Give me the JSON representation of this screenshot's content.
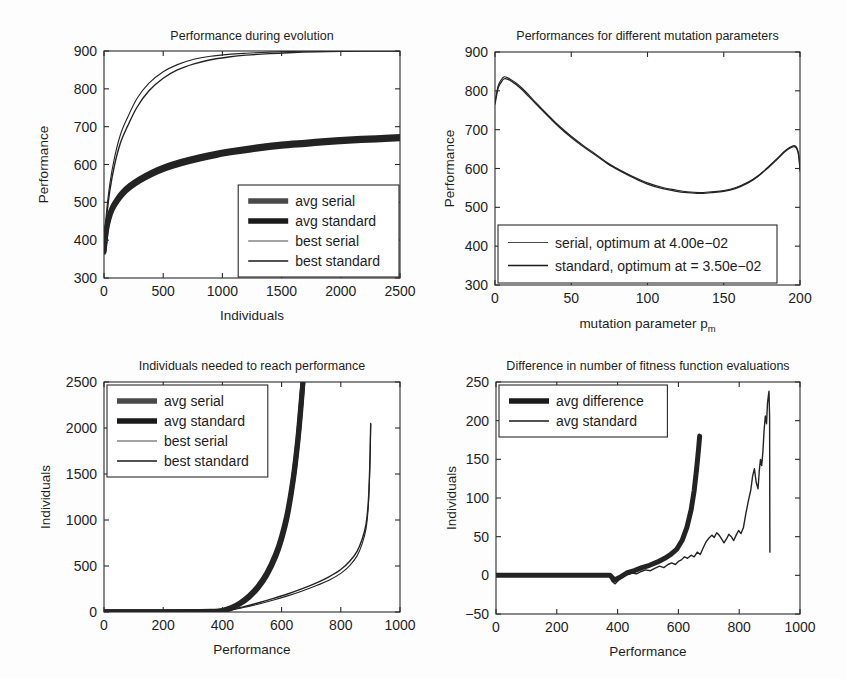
{
  "figure": {
    "background": "#fdfdfd",
    "line_color": "#232323",
    "axis_color": "#2a2a2a"
  },
  "chart_data": [
    {
      "id": "performance-during-evolution",
      "type": "line",
      "title": "Performance during evolution",
      "xlabel": "Individuals",
      "ylabel": "Performance",
      "xlim": [
        0,
        2500
      ],
      "ylim": [
        300,
        900
      ],
      "xticks": [
        0,
        500,
        1000,
        1500,
        2000,
        2500
      ],
      "xticklabels": [
        "0",
        "500",
        "1000",
        "1500",
        "2000",
        "2500"
      ],
      "yticks": [
        300,
        400,
        500,
        600,
        700,
        800,
        900
      ],
      "yticklabels": [
        "300",
        "400",
        "500",
        "600",
        "700",
        "800",
        "900"
      ],
      "grid": false,
      "legend_position": "lower-right",
      "legend": [
        {
          "label": "avg serial",
          "width": 5.5,
          "color": "#4a4a4a"
        },
        {
          "label": "avg standard",
          "width": 5.5,
          "color": "#1a1a1a"
        },
        {
          "label": "best serial",
          "width": 1.1,
          "color": "#4a4a4a"
        },
        {
          "label": "best standard",
          "width": 1.4,
          "color": "#1a1a1a"
        }
      ],
      "series": [
        {
          "name": "avg serial",
          "width": 5.0,
          "color": "#4a4a4a",
          "x": [
            0,
            20,
            40,
            70,
            110,
            160,
            220,
            300,
            400,
            520,
            650,
            800,
            950,
            1100,
            1300,
            1500,
            1700,
            1900,
            2100,
            2300,
            2500
          ],
          "y": [
            372,
            430,
            460,
            487,
            508,
            528,
            545,
            562,
            579,
            595,
            608,
            620,
            630,
            638,
            647,
            654,
            659,
            664,
            668,
            671,
            674
          ]
        },
        {
          "name": "avg standard",
          "width": 5.0,
          "color": "#1a1a1a",
          "x": [
            0,
            20,
            40,
            70,
            110,
            160,
            220,
            300,
            400,
            520,
            650,
            800,
            950,
            1100,
            1300,
            1500,
            1700,
            1900,
            2100,
            2300,
            2500
          ],
          "y": [
            368,
            424,
            454,
            481,
            502,
            522,
            539,
            556,
            573,
            589,
            602,
            614,
            624,
            632,
            641,
            648,
            653,
            658,
            662,
            665,
            668
          ]
        },
        {
          "name": "best serial",
          "width": 1.1,
          "color": "#4a4a4a",
          "x": [
            0,
            20,
            50,
            90,
            140,
            200,
            280,
            380,
            500,
            620,
            760,
            900,
            1050,
            1200,
            1400,
            1600,
            1800,
            2000,
            2200,
            2500
          ],
          "y": [
            390,
            470,
            550,
            620,
            680,
            725,
            775,
            815,
            845,
            864,
            878,
            886,
            891,
            894,
            897,
            899,
            900,
            900,
            900,
            900
          ]
        },
        {
          "name": "best standard",
          "width": 1.4,
          "color": "#1a1a1a",
          "x": [
            0,
            20,
            50,
            90,
            140,
            200,
            280,
            380,
            500,
            620,
            760,
            900,
            1050,
            1200,
            1400,
            1600,
            1800,
            2000,
            2200,
            2500
          ],
          "y": [
            382,
            455,
            532,
            600,
            658,
            702,
            752,
            795,
            828,
            850,
            866,
            877,
            884,
            889,
            893,
            896,
            898,
            899,
            900,
            900
          ]
        }
      ]
    },
    {
      "id": "performances-mutation-parameters",
      "type": "line",
      "title": "Performances for different mutation parameters",
      "xlabel": "mutation parameter p",
      "xlabel_subscript": "m",
      "ylabel": "Performance",
      "xlim": [
        0,
        200
      ],
      "ylim": [
        300,
        900
      ],
      "xticks": [
        0,
        50,
        100,
        150,
        200
      ],
      "xticklabels": [
        "0",
        "50",
        "100",
        "150",
        "200"
      ],
      "yticks": [
        300,
        400,
        500,
        600,
        700,
        800,
        900
      ],
      "yticklabels": [
        "300",
        "400",
        "500",
        "600",
        "700",
        "800",
        "900"
      ],
      "grid": false,
      "legend_position": "lower-left",
      "legend": [
        {
          "label": "serial, optimum at 4.00e−02",
          "width": 1.1,
          "color": "#4a4a4a"
        },
        {
          "label": "standard, optimum at = 3.50e−02",
          "width": 1.3,
          "color": "#1a1a1a"
        }
      ],
      "series": [
        {
          "name": "serial",
          "width": 1.1,
          "color": "#4a4a4a",
          "x": [
            0,
            2,
            4,
            6,
            8,
            10,
            14,
            18,
            22,
            26,
            30,
            36,
            42,
            50,
            58,
            66,
            74,
            82,
            90,
            100,
            110,
            118,
            126,
            134,
            142,
            150,
            158,
            166,
            172,
            178,
            184,
            190,
            194,
            197,
            199,
            200
          ],
          "y": [
            770,
            812,
            828,
            836,
            834,
            830,
            820,
            806,
            790,
            773,
            757,
            733,
            710,
            683,
            659,
            637,
            614,
            596,
            580,
            563,
            551,
            545,
            540,
            538,
            540,
            543,
            551,
            565,
            580,
            600,
            622,
            645,
            656,
            658,
            640,
            598
          ]
        },
        {
          "name": "standard",
          "width": 1.3,
          "color": "#1a1a1a",
          "x": [
            0,
            2,
            4,
            6,
            8,
            10,
            14,
            18,
            22,
            26,
            30,
            36,
            42,
            50,
            58,
            66,
            74,
            82,
            90,
            100,
            110,
            118,
            126,
            134,
            142,
            150,
            158,
            166,
            172,
            178,
            184,
            190,
            194,
            197,
            199,
            200
          ],
          "y": [
            766,
            806,
            822,
            831,
            830,
            827,
            816,
            802,
            786,
            770,
            754,
            730,
            707,
            680,
            656,
            634,
            612,
            594,
            578,
            560,
            548,
            542,
            538,
            536,
            538,
            541,
            549,
            563,
            578,
            598,
            620,
            643,
            654,
            655,
            636,
            594
          ]
        }
      ]
    },
    {
      "id": "individuals-needed-to-reach-performance",
      "type": "line",
      "title": "Individuals needed to reach performance",
      "xlabel": "Performance",
      "ylabel": "Individuals",
      "xlim": [
        0,
        1000
      ],
      "ylim": [
        0,
        2500
      ],
      "xticks": [
        0,
        200,
        400,
        600,
        800,
        1000
      ],
      "xticklabels": [
        "0",
        "200",
        "400",
        "600",
        "800",
        "1000"
      ],
      "yticks": [
        0,
        500,
        1000,
        1500,
        2000,
        2500
      ],
      "yticklabels": [
        "0",
        "500",
        "1000",
        "1500",
        "2000",
        "2500"
      ],
      "grid": false,
      "legend_position": "upper-left",
      "legend": [
        {
          "label": "avg serial",
          "width": 5.5,
          "color": "#4a4a4a"
        },
        {
          "label": "avg standard",
          "width": 5.5,
          "color": "#1a1a1a"
        },
        {
          "label": "best serial",
          "width": 1.1,
          "color": "#4a4a4a"
        },
        {
          "label": "best standard",
          "width": 1.4,
          "color": "#1a1a1a"
        }
      ],
      "series": [
        {
          "name": "avg serial",
          "width": 5.0,
          "color": "#4a4a4a",
          "x": [
            0,
            200,
            360,
            400,
            430,
            460,
            490,
            520,
            550,
            580,
            600,
            620,
            640,
            655,
            665,
            672
          ],
          "y": [
            2,
            3,
            6,
            14,
            40,
            90,
            160,
            260,
            400,
            600,
            790,
            1050,
            1440,
            1850,
            2200,
            2500
          ]
        },
        {
          "name": "avg standard",
          "width": 5.0,
          "color": "#1a1a1a",
          "x": [
            0,
            200,
            360,
            400,
            430,
            460,
            490,
            520,
            550,
            580,
            600,
            620,
            640,
            655,
            665,
            672
          ],
          "y": [
            2,
            3,
            7,
            18,
            48,
            100,
            175,
            280,
            425,
            630,
            825,
            1090,
            1480,
            1890,
            2250,
            2500
          ]
        },
        {
          "name": "best serial",
          "width": 1.1,
          "color": "#4a4a4a",
          "x": [
            0,
            200,
            360,
            420,
            470,
            520,
            570,
            620,
            670,
            720,
            760,
            800,
            830,
            855,
            872,
            885,
            893,
            898,
            901
          ],
          "y": [
            2,
            3,
            7,
            20,
            48,
            85,
            128,
            175,
            228,
            290,
            345,
            420,
            505,
            610,
            740,
            900,
            1150,
            1550,
            2040
          ]
        },
        {
          "name": "best standard",
          "width": 1.4,
          "color": "#1a1a1a",
          "x": [
            0,
            200,
            360,
            420,
            470,
            520,
            570,
            620,
            670,
            720,
            760,
            800,
            830,
            855,
            872,
            885,
            893,
            898,
            901
          ],
          "y": [
            2,
            3,
            8,
            24,
            56,
            98,
            145,
            196,
            254,
            320,
            382,
            462,
            552,
            660,
            790,
            950,
            1200,
            1600,
            2050
          ]
        }
      ]
    },
    {
      "id": "difference-fitness-function-evaluations",
      "type": "line",
      "title": "Difference in number of fitness function evaluations",
      "xlabel": "Performance",
      "ylabel": "Individuals",
      "xlim": [
        0,
        1000
      ],
      "ylim": [
        -50,
        250
      ],
      "xticks": [
        0,
        200,
        400,
        600,
        800,
        1000
      ],
      "xticklabels": [
        "0",
        "200",
        "400",
        "600",
        "800",
        "1000"
      ],
      "yticks": [
        -50,
        0,
        50,
        100,
        150,
        200,
        250
      ],
      "yticklabels": [
        "−50",
        "0",
        "50",
        "100",
        "150",
        "200",
        "250"
      ],
      "grid": false,
      "legend_position": "upper-left",
      "legend": [
        {
          "label": "avg difference",
          "width": 5.5,
          "color": "#1a1a1a"
        },
        {
          "label": "avg standard",
          "width": 1.4,
          "color": "#1a1a1a"
        }
      ],
      "series": [
        {
          "name": "avg difference",
          "width": 5.0,
          "color": "#1a1a1a",
          "x": [
            0,
            120,
            240,
            340,
            375,
            390,
            410,
            430,
            455,
            480,
            505,
            530,
            555,
            575,
            595,
            612,
            628,
            642,
            652,
            660,
            666,
            670
          ],
          "y": [
            0,
            0,
            0,
            0,
            0,
            -6,
            -2,
            3,
            6,
            10,
            13,
            17,
            22,
            27,
            34,
            45,
            62,
            85,
            110,
            138,
            162,
            180
          ]
        },
        {
          "name": "avg standard",
          "width": 1.4,
          "color": "#1a1a1a",
          "x": [
            0,
            120,
            240,
            340,
            372,
            382,
            392,
            404,
            418,
            432,
            448,
            462,
            478,
            492,
            508,
            522,
            538,
            552,
            566,
            578,
            590,
            600,
            610,
            620,
            630,
            642,
            652,
            662,
            672,
            682,
            692,
            700,
            710,
            718,
            726,
            734,
            742,
            750,
            758,
            766,
            774,
            782,
            790,
            798,
            806,
            814,
            822,
            830,
            838,
            844,
            850,
            856,
            862,
            866,
            870,
            874,
            878,
            882,
            886,
            890,
            893,
            896,
            898,
            900,
            901
          ],
          "y": [
            0,
            0,
            0,
            0,
            0,
            -8,
            -11,
            -6,
            -2,
            1,
            3,
            2,
            5,
            7,
            6,
            9,
            12,
            10,
            14,
            16,
            14,
            18,
            20,
            24,
            22,
            26,
            24,
            30,
            27,
            36,
            44,
            48,
            52,
            49,
            55,
            52,
            47,
            42,
            47,
            53,
            50,
            45,
            52,
            58,
            54,
            62,
            80,
            96,
            110,
            128,
            138,
            120,
            112,
            135,
            150,
            142,
            160,
            188,
            206,
            196,
            222,
            232,
            238,
            205,
            30
          ]
        }
      ]
    }
  ]
}
